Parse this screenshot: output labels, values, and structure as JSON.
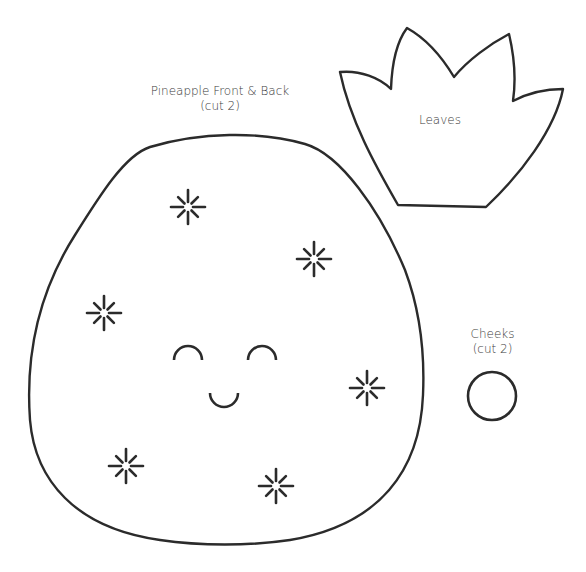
{
  "template": {
    "pineapple": {
      "title": "Pineapple Front & Back",
      "note": "(cut 2)",
      "sparkles": [
        {
          "x": 188,
          "y": 207
        },
        {
          "x": 314,
          "y": 259
        },
        {
          "x": 104,
          "y": 313
        },
        {
          "x": 367,
          "y": 388
        },
        {
          "x": 126,
          "y": 466
        },
        {
          "x": 276,
          "y": 486
        }
      ],
      "face": {
        "left_eye": {
          "x": 188,
          "y": 357
        },
        "right_eye": {
          "x": 262,
          "y": 357
        },
        "mouth": {
          "x": 224,
          "y": 397
        }
      }
    },
    "leaves": {
      "title": "Leaves"
    },
    "cheeks": {
      "title": "Cheeks",
      "note": "(cut 2)"
    }
  },
  "colors": {
    "stroke": "#2b2b2b",
    "text": "#3a3a3a",
    "background": "#ffffff"
  }
}
